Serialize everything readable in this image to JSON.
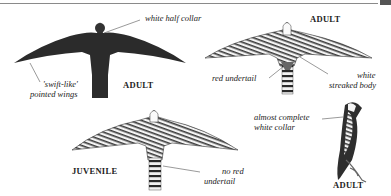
{
  "plate": {
    "figures": [
      {
        "id": "adult-flight-dark",
        "caption": "ADULT",
        "labels": [
          "white half collar",
          "'swift-like'",
          "pointed wings"
        ]
      },
      {
        "id": "adult-flight-underside",
        "caption": "ADULT",
        "labels": [
          "red undertail",
          "white",
          "streaked body"
        ]
      },
      {
        "id": "juvenile-flight",
        "caption": "JUVENILE",
        "labels": [
          "no red",
          "undertail"
        ]
      },
      {
        "id": "adult-perched",
        "caption": "ADULT",
        "labels": [
          "almost complete",
          "white collar"
        ]
      }
    ]
  },
  "colors": {
    "dark_plumage": "#2b2b2b",
    "rule": "#8a8a8a",
    "text": "#222222"
  }
}
